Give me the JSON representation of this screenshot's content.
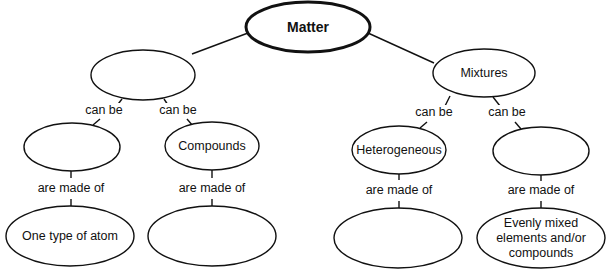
{
  "diagram": {
    "type": "concept-map",
    "nodes": {
      "matter": {
        "label": "Matter"
      },
      "pure_substances": {
        "label": ""
      },
      "mixtures": {
        "label": "Mixtures"
      },
      "elements": {
        "label": ""
      },
      "compounds": {
        "label": "Compounds"
      },
      "heterogeneous": {
        "label": "Heterogeneous"
      },
      "homogeneous": {
        "label": ""
      },
      "one_type_atom": {
        "label": "One type of atom"
      },
      "compounds_made_of": {
        "label": ""
      },
      "heterogeneous_made_of": {
        "label": ""
      },
      "evenly_mixed": {
        "label": "Evenly mixed elements and/or compounds"
      }
    },
    "links": {
      "l1": "can be",
      "l2": "can be",
      "l3": "can be",
      "l4": "can be",
      "m1": "are made of",
      "m2": "are made of",
      "m3": "are made of",
      "m4": "are made of"
    }
  }
}
